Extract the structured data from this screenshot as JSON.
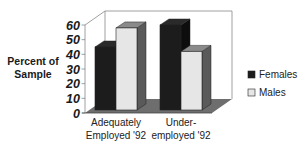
{
  "chart_data": {
    "type": "bar",
    "style": "3d-clustered-column",
    "title": "",
    "xlabel": "",
    "ylabel": "Percent of Sample",
    "ylim": [
      0,
      60
    ],
    "yticks": [
      0,
      10,
      20,
      30,
      40,
      50,
      60
    ],
    "categories": [
      "Adequately Employed '92",
      "Under-employed '92"
    ],
    "category_lines": [
      [
        "Adequately",
        "Employed '92"
      ],
      [
        "Under-",
        "employed '92"
      ]
    ],
    "series": [
      {
        "name": "Females",
        "values": [
          45,
          60
        ],
        "color": "#1c1c1c"
      },
      {
        "name": "Males",
        "values": [
          58,
          42
        ],
        "color": "#e6e6e6"
      }
    ],
    "grid": false,
    "legend_position": "right",
    "floor_color": "#6e6e6e",
    "wall_color": "#ffffff"
  }
}
